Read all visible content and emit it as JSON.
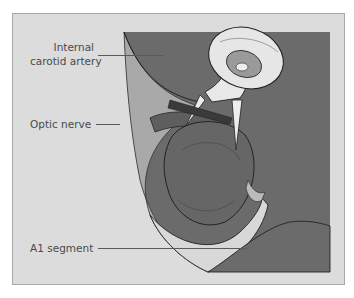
{
  "figure": {
    "labels": {
      "ica_line1": "Internal",
      "ica_line2": "carotid artery",
      "optic_nerve": "Optic nerve",
      "a1_segment": "A1 segment"
    },
    "colors": {
      "frame_background": "#dcdcdc",
      "field_dark": "#6b6b6b",
      "nerve_light": "#bdbdbd",
      "clip_metal": "#e6e6e6",
      "leader_line": "#5a5a5a"
    }
  }
}
